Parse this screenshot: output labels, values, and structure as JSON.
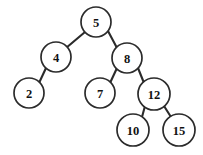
{
  "diagram": {
    "type": "binary-search-tree",
    "background_color": "#ffffff",
    "node_fill_color": "#ffffff",
    "node_stroke_color": "#2b2b2b",
    "edge_color": "#2b2b2b",
    "label_color": "#111111",
    "node_count": 8,
    "edge_count": 7,
    "root_value": "5"
  },
  "nodes": [
    {
      "id": "n5",
      "label": "5",
      "value": 5,
      "cx": 96,
      "cy": 22,
      "r": 15,
      "depth": 0
    },
    {
      "id": "n4",
      "label": "4",
      "value": 4,
      "cx": 56,
      "cy": 57,
      "r": 15,
      "depth": 1
    },
    {
      "id": "n8",
      "label": "8",
      "value": 8,
      "cx": 127,
      "cy": 58,
      "r": 15,
      "depth": 1
    },
    {
      "id": "n2",
      "label": "2",
      "value": 2,
      "cx": 29,
      "cy": 93,
      "r": 15,
      "depth": 2
    },
    {
      "id": "n7",
      "label": "7",
      "value": 7,
      "cx": 100,
      "cy": 93,
      "r": 15,
      "depth": 2
    },
    {
      "id": "n12",
      "label": "12",
      "value": 12,
      "cx": 154,
      "cy": 94,
      "r": 16,
      "depth": 2
    },
    {
      "id": "n10",
      "label": "10",
      "value": 10,
      "cx": 133,
      "cy": 130,
      "r": 16,
      "depth": 3
    },
    {
      "id": "n15",
      "label": "15",
      "value": 15,
      "cx": 179,
      "cy": 130,
      "r": 16,
      "depth": 3
    }
  ],
  "edges": [
    {
      "id": "e5-4",
      "from": "n5",
      "to": "n4",
      "side": "left",
      "x1": 85,
      "y1": 32,
      "x2": 66,
      "y2": 48
    },
    {
      "id": "e5-8",
      "from": "n5",
      "to": "n8",
      "side": "right",
      "x1": 108,
      "y1": 31,
      "x2": 117,
      "y2": 48
    },
    {
      "id": "e4-2",
      "from": "n4",
      "to": "n2",
      "side": "left",
      "x1": 46,
      "y1": 68,
      "x2": 39,
      "y2": 83
    },
    {
      "id": "e8-7",
      "from": "n8",
      "to": "n7",
      "side": "left",
      "x1": 117,
      "y1": 68,
      "x2": 110,
      "y2": 83
    },
    {
      "id": "e8-12",
      "from": "n8",
      "to": "n12",
      "side": "right",
      "x1": 138,
      "y1": 68,
      "x2": 144,
      "y2": 83
    },
    {
      "id": "e12-10",
      "from": "n12",
      "to": "n10",
      "side": "left",
      "x1": 145,
      "y1": 106,
      "x2": 142,
      "y2": 117
    },
    {
      "id": "e12-15",
      "from": "n12",
      "to": "n15",
      "side": "right",
      "x1": 164,
      "y1": 106,
      "x2": 171,
      "y2": 117
    }
  ]
}
